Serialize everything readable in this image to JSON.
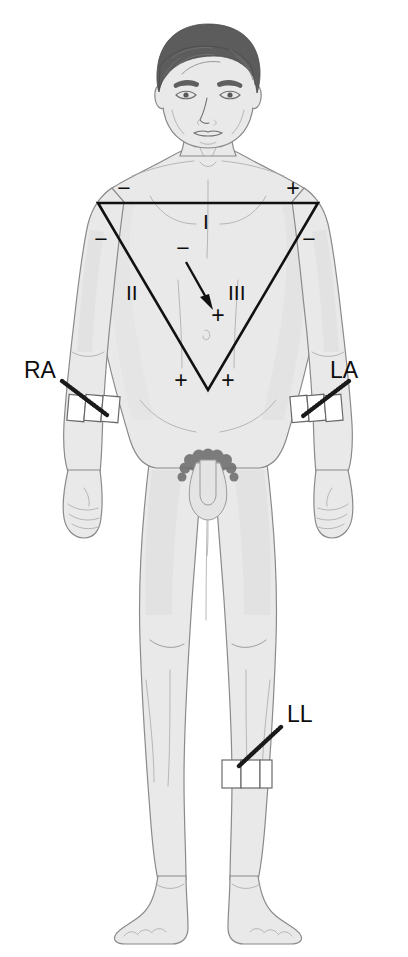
{
  "illustration": {
    "title": "Einthoven's Triangle - ECG Limb Lead Placement",
    "subject": "anterior view of standing adult male figure",
    "background_color": "#ffffff",
    "body_fill_color": "#e9e9e9",
    "body_outline_color": "#8a8a8a",
    "hair_color": "#5c5c5c",
    "ink_color": "#111111",
    "strap_color": "#ffffff"
  },
  "electrodes": [
    {
      "id": "RA",
      "label": "RA",
      "meaning": "right arm",
      "label_x": 24,
      "label_y": 378,
      "strap_site": "right forearm below elbow",
      "cable_from_x": 62,
      "cable_from_y": 381,
      "cable_to_x": 97,
      "cable_to_y": 412
    },
    {
      "id": "LA",
      "label": "LA",
      "meaning": "left arm",
      "label_x": 330,
      "label_y": 378,
      "strap_site": "left forearm below elbow",
      "cable_from_x": 349,
      "cable_from_y": 381,
      "cable_to_x": 311,
      "cable_to_y": 413
    },
    {
      "id": "LL",
      "label": "LL",
      "meaning": "left leg",
      "label_x": 287,
      "label_y": 722,
      "strap_site": "left lower leg below knee",
      "cable_from_x": 281,
      "cable_from_y": 727,
      "cable_to_x": 243,
      "cable_to_y": 763
    }
  ],
  "triangle": {
    "name": "Einthoven's triangle",
    "vertices": [
      {
        "name": "right-shoulder",
        "x": 98,
        "y": 203
      },
      {
        "name": "left-shoulder",
        "x": 318,
        "y": 203
      },
      {
        "name": "pelvis-apex",
        "x": 208,
        "y": 390
      }
    ],
    "leads": [
      {
        "label": "I",
        "x": 206,
        "y": 222,
        "side": "top"
      },
      {
        "label": "II",
        "x": 128,
        "y": 300,
        "side": "left"
      },
      {
        "label": "III",
        "x": 232,
        "y": 300,
        "side": "right"
      }
    ],
    "polarity_markers": [
      {
        "sign": "−",
        "x": 124,
        "y": 196,
        "at": "lead-I-negative-right-shoulder"
      },
      {
        "sign": "+",
        "x": 293,
        "y": 196,
        "at": "lead-I-positive-left-shoulder"
      },
      {
        "sign": "−",
        "x": 101,
        "y": 247,
        "at": "lead-II-negative"
      },
      {
        "sign": "−",
        "x": 309,
        "y": 247,
        "at": "lead-III-negative"
      },
      {
        "sign": "+",
        "x": 181,
        "y": 388,
        "at": "lead-II-positive"
      },
      {
        "sign": "+",
        "x": 228,
        "y": 388,
        "at": "lead-III-positive"
      }
    ],
    "axis_arrow": {
      "name": "mean cardiac axis vector",
      "from_x": 186,
      "from_y": 262,
      "to_x": 212,
      "to_y": 308,
      "negative_sign": "−",
      "negative_x": 183,
      "negative_y": 256,
      "positive_sign": "+",
      "positive_x": 218,
      "positive_y": 323
    }
  }
}
